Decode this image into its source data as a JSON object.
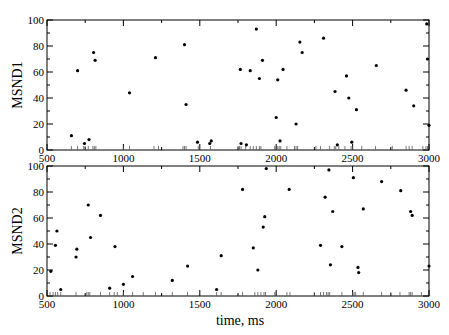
{
  "chart_data": [
    {
      "type": "scatter",
      "title": "",
      "xlabel": "",
      "ylabel": "MSND1",
      "xlim": [
        500,
        3000
      ],
      "ylim": [
        0,
        100
      ],
      "xticks": [
        500,
        1000,
        1500,
        2000,
        2500,
        3000
      ],
      "yticks": [
        0,
        20,
        40,
        60,
        80,
        100
      ],
      "grid": false,
      "legend": null,
      "points": [
        [
          660,
          11
        ],
        [
          700,
          61
        ],
        [
          745,
          5
        ],
        [
          775,
          8
        ],
        [
          805,
          75
        ],
        [
          815,
          69
        ],
        [
          1040,
          44
        ],
        [
          1210,
          71
        ],
        [
          1400,
          81
        ],
        [
          1410,
          35
        ],
        [
          1485,
          6
        ],
        [
          1565,
          5
        ],
        [
          1575,
          7
        ],
        [
          1765,
          62
        ],
        [
          1770,
          5
        ],
        [
          1805,
          4
        ],
        [
          1830,
          61
        ],
        [
          1870,
          93
        ],
        [
          1890,
          55
        ],
        [
          1910,
          69
        ],
        [
          2000,
          25
        ],
        [
          2010,
          54
        ],
        [
          2025,
          7
        ],
        [
          2045,
          62
        ],
        [
          2130,
          20
        ],
        [
          2155,
          83
        ],
        [
          2170,
          75
        ],
        [
          2310,
          86
        ],
        [
          2385,
          45
        ],
        [
          2400,
          4
        ],
        [
          2460,
          57
        ],
        [
          2475,
          40
        ],
        [
          2495,
          6
        ],
        [
          2525,
          31
        ],
        [
          2655,
          65
        ],
        [
          2850,
          46
        ],
        [
          2900,
          34
        ],
        [
          2985,
          97
        ],
        [
          2990,
          70
        ],
        [
          3000,
          19
        ]
      ],
      "rug_x": [
        660,
        700,
        740,
        750,
        770,
        800,
        810,
        820,
        1000,
        1040,
        1200,
        1230,
        1390,
        1400,
        1410,
        1490,
        1570,
        1750,
        1760,
        1770,
        1800,
        1830,
        1850,
        1870,
        1890,
        1900,
        1990,
        2000,
        2010,
        2020,
        2030,
        2070,
        2120,
        2130,
        2140,
        2260,
        2290,
        2350,
        2380,
        2390,
        2410,
        2450,
        2490,
        2500,
        2560,
        2650,
        2760,
        2850,
        2870,
        2890,
        2960,
        2980,
        2990
      ]
    },
    {
      "type": "scatter",
      "title": "",
      "xlabel": "time, ms",
      "ylabel": "MSND2",
      "xlim": [
        500,
        3000
      ],
      "ylim": [
        0,
        100
      ],
      "xticks": [
        500,
        1000,
        1500,
        2000,
        2500,
        3000
      ],
      "yticks": [
        0,
        20,
        40,
        60,
        80,
        100
      ],
      "grid": false,
      "legend": null,
      "points": [
        [
          525,
          19
        ],
        [
          555,
          39
        ],
        [
          565,
          50
        ],
        [
          590,
          5
        ],
        [
          690,
          30
        ],
        [
          695,
          36
        ],
        [
          770,
          70
        ],
        [
          785,
          45
        ],
        [
          850,
          62
        ],
        [
          910,
          6
        ],
        [
          945,
          38
        ],
        [
          1000,
          9
        ],
        [
          1060,
          15
        ],
        [
          1320,
          12
        ],
        [
          1420,
          23
        ],
        [
          1610,
          5
        ],
        [
          1640,
          31
        ],
        [
          1780,
          82
        ],
        [
          1850,
          37
        ],
        [
          1880,
          20
        ],
        [
          1915,
          53
        ],
        [
          1925,
          61
        ],
        [
          1935,
          98
        ],
        [
          2085,
          82
        ],
        [
          2290,
          39
        ],
        [
          2320,
          76
        ],
        [
          2345,
          97
        ],
        [
          2355,
          24
        ],
        [
          2370,
          65
        ],
        [
          2430,
          38
        ],
        [
          2505,
          91
        ],
        [
          2535,
          22
        ],
        [
          2540,
          18
        ],
        [
          2570,
          67
        ],
        [
          2690,
          88
        ],
        [
          2815,
          81
        ],
        [
          2880,
          65
        ],
        [
          2890,
          62
        ],
        [
          3000,
          23
        ]
      ],
      "rug_x": [
        520,
        540,
        555,
        570,
        590,
        690,
        760,
        770,
        780,
        850,
        910,
        940,
        960,
        1000,
        1060,
        1130,
        1210,
        1320,
        1420,
        1610,
        1640,
        1780,
        1860,
        1880,
        1900,
        1920,
        1930,
        1990,
        2000,
        2070,
        2090,
        2250,
        2290,
        2310,
        2330,
        2340,
        2350,
        2430,
        2500,
        2510,
        2520,
        2570,
        2690,
        2750,
        2810,
        2870,
        2880,
        2890,
        2950
      ]
    }
  ],
  "labels": {
    "top_ylabel": "MSND1",
    "bottom_ylabel": "MSND2",
    "xlabel": "time, ms"
  },
  "colors": {
    "dot": "#000000",
    "axis": "#000000",
    "background": "#ffffff"
  }
}
